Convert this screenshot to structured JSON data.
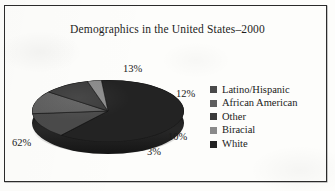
{
  "chart_data": {
    "type": "pie",
    "title": "Demographics in the United States–2000",
    "three_d": true,
    "categories": [
      "Latino/Hispanic",
      "African American",
      "Other",
      "Biracial",
      "White"
    ],
    "values": [
      13,
      12,
      10,
      3,
      62
    ],
    "value_labels": [
      "13%",
      "12%",
      "10%",
      "3%",
      "62%"
    ],
    "unit": "%",
    "legend_position": "right",
    "grid": false,
    "colors": [
      "#4a4a4a",
      "#5e5e5e",
      "#3a3a3a",
      "#8a8a8a",
      "#232323"
    ],
    "slices": [
      {
        "label": "Latino/Hispanic",
        "value": 13,
        "display": "13%",
        "color": "#4a4a4a"
      },
      {
        "label": "African American",
        "value": 12,
        "display": "12%",
        "color": "#5e5e5e"
      },
      {
        "label": "Other",
        "value": 10,
        "display": "10%",
        "color": "#3a3a3a"
      },
      {
        "label": "Biracial",
        "value": 3,
        "display": "3%",
        "color": "#8a8a8a"
      },
      {
        "label": "White",
        "value": 62,
        "display": "62%",
        "color": "#232323"
      }
    ]
  },
  "legend": {
    "items": [
      {
        "label": "Latino/Hispanic",
        "color": "#4a4a4a"
      },
      {
        "label": "African American",
        "color": "#5e5e5e"
      },
      {
        "label": "Other",
        "color": "#3a3a3a"
      },
      {
        "label": "Biracial",
        "color": "#8a8a8a"
      },
      {
        "label": "White",
        "color": "#232323"
      }
    ]
  },
  "frame": {
    "border_color": "#2b2b2b"
  },
  "background": "#fdfdfb"
}
